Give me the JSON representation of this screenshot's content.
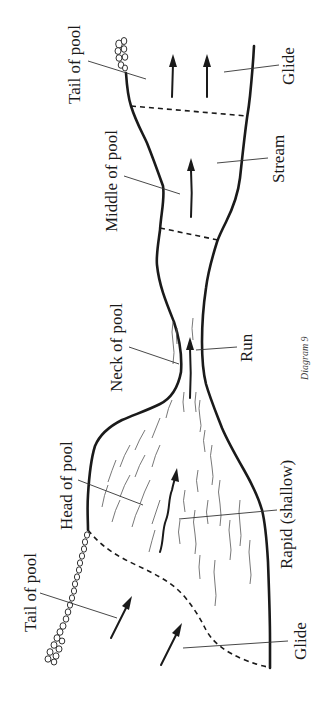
{
  "diagram": {
    "caption": "Diagram 9",
    "labels": {
      "tail_of_pool_top": "Tail of pool",
      "glide_top": "Glide",
      "middle_of_pool": "Middle of pool",
      "stream": "Stream",
      "neck_of_pool": "Neck of pool",
      "run": "Run",
      "head_of_pool": "Head of pool",
      "rapid_shallow": "Rapid (shallow)",
      "tail_of_pool_bottom": "Tail of pool",
      "glide_bottom": "Glide"
    },
    "colors": {
      "ink": "#1a1a1a",
      "background": "#ffffff"
    },
    "orientation": "rotated 90 degrees counter-clockwise; flow arrows point up the page"
  }
}
